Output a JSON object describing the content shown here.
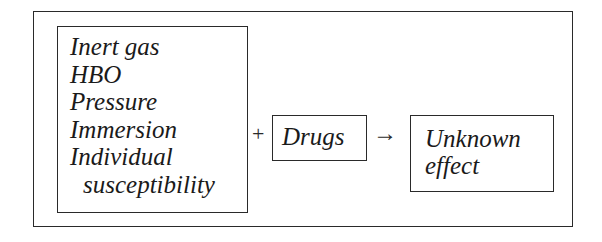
{
  "diagram": {
    "factors": [
      {
        "label": "Inert gas",
        "indent": false
      },
      {
        "label": "HBO",
        "indent": false
      },
      {
        "label": "Pressure",
        "indent": false
      },
      {
        "label": "Immersion",
        "indent": false
      },
      {
        "label": "Individual",
        "indent": false
      },
      {
        "label": "susceptibility",
        "indent": true
      }
    ],
    "plus_symbol": "+",
    "drugs_label": "Drugs",
    "arrow_symbol": "→",
    "effect_lines": [
      "Unknown",
      "effect"
    ],
    "colors": {
      "line": "#2a2a2a",
      "text": "#1a1a1a",
      "background": "#ffffff"
    }
  }
}
